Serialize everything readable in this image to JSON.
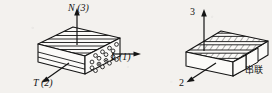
{
  "figure": {
    "background_color": "#f3f1ee",
    "ink_color": "#141414",
    "panels": [
      {
        "id": "unidirectional-fiber-composite",
        "labels": [
          {
            "key": "axis_n",
            "text": "N (3)",
            "style": "italic-leading"
          },
          {
            "key": "axis_l",
            "text": "L (1)",
            "style": "italic-leading"
          },
          {
            "key": "axis_t",
            "text": "T (2)",
            "style": "italic-leading"
          }
        ],
        "face_patterns": {
          "top": "parallel-fiber-lines",
          "front": "parallel-fiber-lines",
          "right": "fiber-cross-section-circles"
        }
      },
      {
        "id": "laminated-composite",
        "labels": [
          {
            "key": "axis_3",
            "text": "3",
            "style": "plain"
          },
          {
            "key": "axis_2",
            "text": "2",
            "style": "plain"
          }
        ],
        "caption": "串联",
        "face_patterns": {
          "top": "hatched-laminae-bands",
          "front": "plain",
          "right": "stepped-lamina-end"
        }
      }
    ]
  },
  "labels": {
    "axis_n": "N (3)",
    "axis_l": "L (1)",
    "axis_t": "T (2)",
    "axis_3": "3",
    "axis_2": "2",
    "caption_cn": "串联"
  }
}
